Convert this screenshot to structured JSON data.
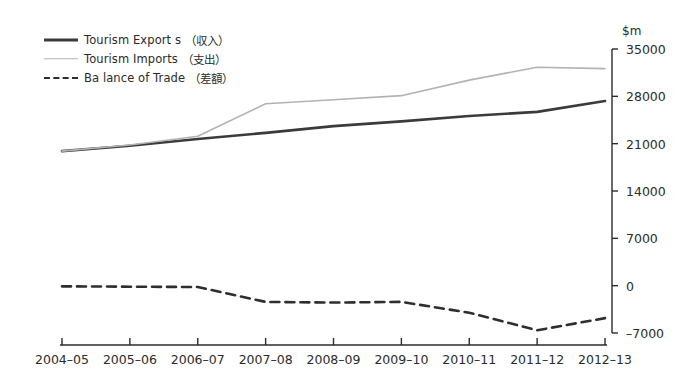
{
  "chart_data": {
    "type": "line",
    "title": "",
    "xlabel": "",
    "ylabel": "$m",
    "unit_label": "$m",
    "categories": [
      "2004–05",
      "2005–06",
      "2006–07",
      "2007–08",
      "2008–09",
      "2009–10",
      "2010–11",
      "2011–12",
      "2012–13"
    ],
    "ylim": [
      -7000,
      35000
    ],
    "yticks": [
      35000,
      28000,
      21000,
      14000,
      7000,
      0,
      -7000
    ],
    "ytick_labels": [
      "35000",
      "28000",
      "21000",
      "14000",
      "7000",
      "0",
      "–7000"
    ],
    "grid": false,
    "legend_position": "top-left",
    "series": [
      {
        "name": "Tourism Export s",
        "name_jp": "（収入）",
        "style": "solid-thick",
        "color": "#3b3b3b",
        "values": [
          19900,
          20700,
          21700,
          22600,
          23600,
          24300,
          25100,
          25700,
          27300
        ]
      },
      {
        "name": "Tourism Imports",
        "name_jp": "（支出）",
        "style": "solid-thin",
        "color": "#b3b3b3",
        "values": [
          19900,
          20800,
          22100,
          26900,
          27500,
          28100,
          30400,
          32300,
          32100
        ]
      },
      {
        "name": "Ba lance of Trade",
        "name_jp": "（差額）",
        "style": "dashed",
        "color": "#2e2e2e",
        "values": [
          -100,
          -150,
          -200,
          -2400,
          -2500,
          -2400,
          -4000,
          -6600,
          -4800
        ]
      }
    ]
  },
  "legend": {
    "items": [
      {
        "label": "Tourism Export s",
        "jp": "（収入）",
        "swatch": "solid-thick-line-icon"
      },
      {
        "label": "Tourism Imports",
        "jp": "（支出）",
        "swatch": "solid-thin-line-icon"
      },
      {
        "label": "Ba lance of Trade",
        "jp": "（差額）",
        "swatch": "dashed-line-icon"
      }
    ]
  },
  "axes": {
    "unit": "$m"
  }
}
